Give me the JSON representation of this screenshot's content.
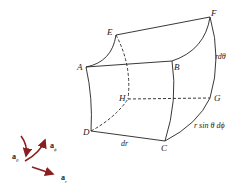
{
  "diagram": {
    "vertices": {
      "A": "A",
      "B": "B",
      "C": "C",
      "D": "D",
      "E": "E",
      "F": "F",
      "G": "G",
      "H": "H"
    },
    "dimensions": {
      "radial": "dr",
      "polar": "rdθ",
      "azimuthal": "r sin θ dϕ"
    },
    "unit_vectors": {
      "r": {
        "base": "a",
        "sub": "r"
      },
      "theta": {
        "base": "a",
        "sub": "θ"
      },
      "phi": {
        "base": "a",
        "sub": "ϕ"
      }
    },
    "colors": {
      "line": "#222222",
      "vector": "#8b1e1e"
    }
  }
}
